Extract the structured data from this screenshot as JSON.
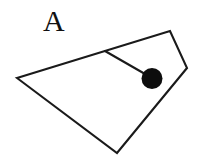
{
  "figure": {
    "panel_label": "A",
    "label_position": {
      "x": 43,
      "y": 31
    },
    "canvas": {
      "width": 206,
      "height": 158
    },
    "background_color": "#ffffff",
    "stroke_color": "#1a1a1a",
    "fill_color": "#ffffff",
    "dot_color": "#0d0d0d",
    "stroke_width": 2.1,
    "shapes": {
      "polygon": {
        "name": "quadrilateral-outline",
        "points": "17,78 170,31 187,68 117,153",
        "vertex_list": [
          {
            "label": "left-vertex",
            "x": 17,
            "y": 78
          },
          {
            "label": "top-right-vertex",
            "x": 170,
            "y": 31
          },
          {
            "label": "right-vertex",
            "x": 187,
            "y": 68
          },
          {
            "label": "bottom-vertex",
            "x": 117,
            "y": 153
          }
        ]
      },
      "stem": {
        "name": "connector-segment",
        "x1": 105,
        "y1": 51,
        "x2": 152,
        "y2": 78
      },
      "dot": {
        "name": "filled-node",
        "cx": 152,
        "cy": 78.5,
        "r": 10.5
      }
    }
  }
}
